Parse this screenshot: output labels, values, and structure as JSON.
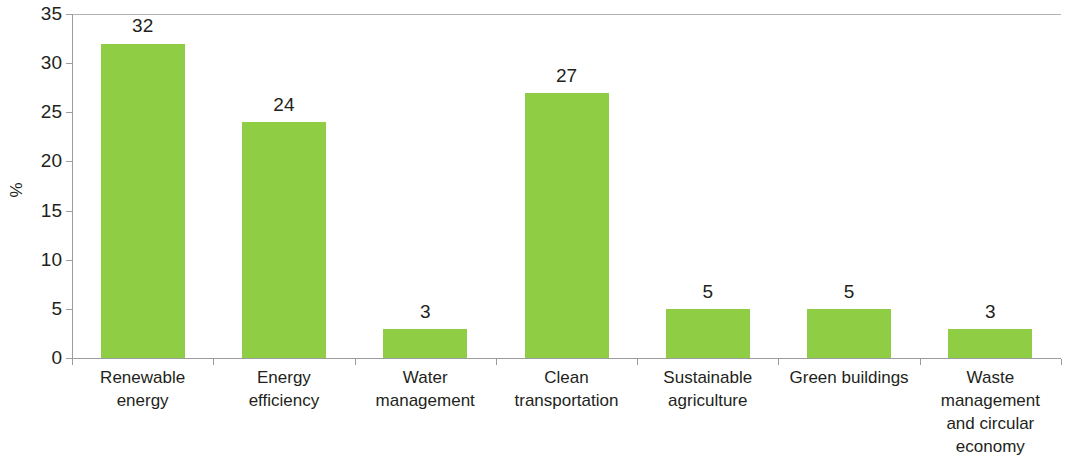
{
  "chart_data": {
    "type": "bar",
    "title": "",
    "xlabel": "",
    "ylabel": "%",
    "ylim": [
      0,
      35
    ],
    "yticks": [
      0,
      5,
      10,
      15,
      20,
      25,
      30,
      35
    ],
    "ytick_labels": [
      "0",
      "5",
      "10",
      "15",
      "20",
      "25",
      "30",
      "35"
    ],
    "grid": false,
    "legend": null,
    "bar_color": "#8fce44",
    "axis_color": "#9c9c9c",
    "text_color": "#231f20",
    "categories": [
      "Renewable energy",
      "Energy efficiency",
      "Water management",
      "Clean transportation",
      "Sustainable agriculture",
      "Green buildings",
      "Waste management and circular economy"
    ],
    "category_lines": [
      [
        "Renewable",
        "energy"
      ],
      [
        "Energy",
        "efficiency"
      ],
      [
        "Water",
        "management"
      ],
      [
        "Clean",
        "transportation"
      ],
      [
        "Sustainable",
        "agriculture"
      ],
      [
        "Green buildings"
      ],
      [
        "Waste",
        "management",
        "and circular",
        "economy"
      ]
    ],
    "values": [
      32,
      24,
      3,
      27,
      5,
      5,
      3
    ],
    "value_labels": [
      "32",
      "24",
      "3",
      "27",
      "5",
      "5",
      "3"
    ]
  }
}
